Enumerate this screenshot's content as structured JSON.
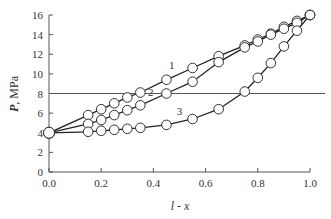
{
  "chart_data": {
    "type": "line",
    "title": "",
    "xlabel": "l - x",
    "ylabel": "P, MPa",
    "xlim": [
      0.0,
      1.0
    ],
    "ylim": [
      0,
      16
    ],
    "xticks": [
      "0.0",
      "0.2",
      "0.4",
      "0.6",
      "0.8",
      "1.0"
    ],
    "yticks": [
      "0",
      "2",
      "4",
      "6",
      "8",
      "10",
      "12",
      "14",
      "16"
    ],
    "grid": false,
    "legend": "inline curve labels 1, 2, 3",
    "reference_line": {
      "y": 8
    },
    "series": [
      {
        "name": "1",
        "x": [
          0.0,
          0.15,
          0.2,
          0.25,
          0.3,
          0.35,
          0.45,
          0.55,
          0.65,
          0.75,
          0.8,
          0.85,
          0.9,
          0.95,
          1.0
        ],
        "y": [
          4.0,
          5.8,
          6.4,
          7.0,
          7.6,
          8.1,
          9.4,
          10.6,
          11.8,
          12.9,
          13.5,
          14.1,
          14.8,
          15.4,
          16.0
        ]
      },
      {
        "name": "2",
        "x": [
          0.0,
          0.15,
          0.2,
          0.25,
          0.3,
          0.35,
          0.45,
          0.55,
          0.65,
          0.75,
          0.8,
          0.85,
          0.9,
          0.95,
          1.0
        ],
        "y": [
          4.0,
          4.9,
          5.3,
          5.8,
          6.3,
          6.8,
          8.0,
          9.2,
          11.2,
          12.7,
          13.3,
          14.0,
          14.6,
          15.2,
          16.0
        ]
      },
      {
        "name": "3",
        "x": [
          0.0,
          0.15,
          0.2,
          0.25,
          0.3,
          0.35,
          0.45,
          0.55,
          0.65,
          0.75,
          0.8,
          0.85,
          0.9,
          0.95,
          1.0
        ],
        "y": [
          4.0,
          4.1,
          4.2,
          4.3,
          4.4,
          4.5,
          4.8,
          5.4,
          6.4,
          8.2,
          9.6,
          11.1,
          12.8,
          14.4,
          16.0
        ]
      }
    ],
    "labels": [
      {
        "text": "1",
        "x": 0.47,
        "y": 10.5
      },
      {
        "text": "2",
        "x": 0.39,
        "y": 7.7
      },
      {
        "text": "3",
        "x": 0.5,
        "y": 5.8
      }
    ]
  }
}
